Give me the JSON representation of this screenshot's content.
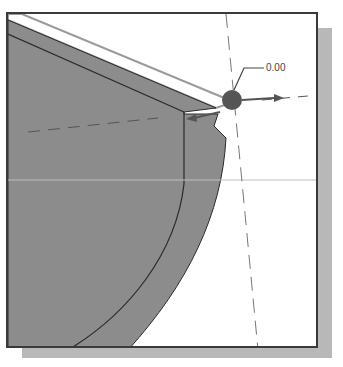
{
  "viewport": {
    "background": "#ffffff",
    "border_color": "#3a3a3a",
    "shadow_color": "#b8b8b8"
  },
  "model": {
    "face_color": "#8c8c8c",
    "face_dark_color": "#7a7a7a",
    "edge_color": "#2a2a2a",
    "highlight_edge_color": "#9a9a9a"
  },
  "dimension": {
    "value_label": "0.00",
    "handle_color": "#555555",
    "arrow_color": "#555555"
  },
  "centerlines": {
    "color": "#777777",
    "style": "dashed"
  }
}
